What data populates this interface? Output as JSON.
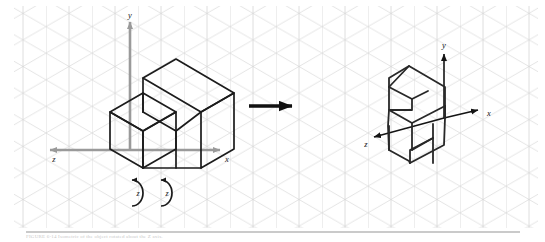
{
  "figure": {
    "kind": "isometric-drawing-figure",
    "caption": "FIGURE 6-14  Isometric of the object rotated about the Z axis.",
    "background_color": "#ffffff",
    "grid": {
      "name": "isometric-triangle-grid",
      "color": "#d6d6d6",
      "color_vertical": "#cfcfcf",
      "spacing_px": 23,
      "visible": true
    },
    "rule": {
      "color": "#b8b8b8",
      "y": 232
    }
  },
  "left_panel": {
    "name": "original-orientation",
    "object_color": "#1a1a1a",
    "axes": {
      "color": "#9a9a9a",
      "label_color": "#222222",
      "items": [
        {
          "id": "y",
          "label": "y",
          "direction": "up"
        },
        {
          "id": "x",
          "label": "x",
          "direction": "lower-right"
        },
        {
          "id": "z",
          "label": "z",
          "direction": "lower-left"
        }
      ]
    },
    "rotation_symbols": [
      {
        "id": "rot-z-1",
        "label": "z",
        "direction": "counterclockwise"
      },
      {
        "id": "rot-z-2",
        "label": "z",
        "direction": "counterclockwise"
      }
    ]
  },
  "transition": {
    "name": "transition-arrow",
    "color": "#111111",
    "direction": "right"
  },
  "right_panel": {
    "name": "rotated-orientation",
    "object_color": "#262626",
    "style": "hand-sketched",
    "axes": {
      "color": "#111111",
      "label_color": "#111111",
      "items": [
        {
          "id": "y",
          "label": "y",
          "direction": "up"
        },
        {
          "id": "x",
          "label": "x",
          "direction": "right"
        },
        {
          "id": "z",
          "label": "z",
          "direction": "lower-left"
        }
      ]
    }
  }
}
